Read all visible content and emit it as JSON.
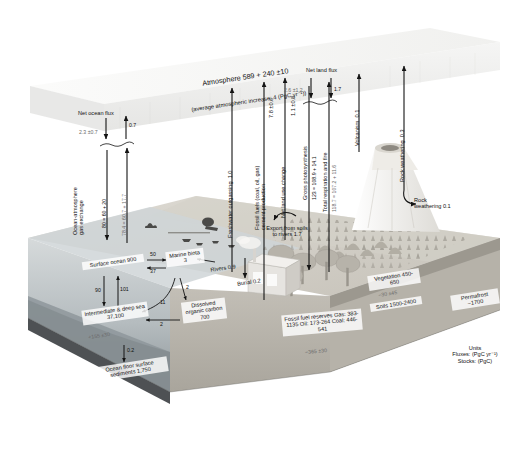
{
  "figure": {
    "units_box": {
      "heading": "Units",
      "fluxes": "Fluxes: (PgC yr⁻¹)",
      "stocks": "Stocks: (PgC)"
    }
  },
  "atmosphere": {
    "line1": "Atmosphere 589 + 240 ±10",
    "line2": "(average atmospheric increase: 4 (PgC yr⁻¹))"
  },
  "ocean": {
    "net_ocean_flux_label": "Net ocean flux",
    "net_ocean_flux_down": "2.3 ±0.7",
    "net_ocean_flux_up": "0.7",
    "gas_exchange_label": "Ocean-atmosphere\ngas exchange",
    "gas_exchange_down": "80 = 60 + 20",
    "gas_exchange_up": "78.4 = 60.7 + 17.7",
    "surface_ocean": "Surface ocean\n900",
    "down_flux": "90",
    "up_flux": "101",
    "intermediate_deep": "Intermediate\n& deep sea\n37,100",
    "intermediate_change": "+155 ±30",
    "to_sediments": "0.2",
    "sediments": "Ocean floor\nsurface sediments\n1,750",
    "marine_biota": "Marine\nbiota\n3",
    "biota_in": "50",
    "biota_out": "37",
    "biota_to_doc": "2",
    "doc": "Dissolved\norganic\ncarbon\n700",
    "doc_to_deep": "2",
    "biota_to_deep": "11",
    "rivers": "Rivers\n0.9",
    "burial": "Burial\n0.2",
    "freshwater_outgassing": "Freshwater outgassing  1.0"
  },
  "land": {
    "fossil_fuels": "Fossil fuels (coal, oil, gas)\ncement production",
    "fossil_fuels_value": "7.8 ±0.6",
    "net_land_use_change": "Net land use change",
    "net_land_use_change_value": "1.1 ±0.8",
    "net_land_flux_label": "Net land flux",
    "net_land_flux_down": "2.6 ±1.2",
    "net_land_flux_up": "1.7",
    "gross_photosynthesis": "Gross photosynthesis",
    "gross_photosynthesis_value": "123 = 108.9 + 14.1",
    "total_respiration": "Total respiration and fire",
    "total_respiration_value": "118.7 = 107.2 + 11.6",
    "export_soils_rivers": "Export from\nsoils to rivers\n1.7",
    "volcanism": "Volcanism  0.1",
    "rock_weathering_top": "Rock weathering  0.3",
    "rock_weathering_land": "Rock\nweathering\n0.1",
    "vegetation": "Vegetation\n450-650",
    "vegetation_soils_change": "−30 ±45",
    "soils": "Soils\n1500-2400",
    "permafrost": "Permafrost\n~1700",
    "fossil_fuel_reserves": "Fossil fuel reserves\nGas: 383-1135\nOil: 173-264\nCoal: 446-541",
    "fossil_fuel_reserves_change": "−365 ±30"
  },
  "colors": {
    "background": "#ffffff",
    "atmosphere_slab": "#ededec",
    "ocean_block": "#cfd4d6",
    "ocean_deep": "#9aa2a6",
    "land_block": "#c9c6c0",
    "land_surface": "#d7d4cd",
    "arrow": "#141414",
    "text": "#111111",
    "text_grey": "#6b6b6b",
    "box_fill": "#f7f7f5",
    "volcano": "#f2f1ee",
    "vegetation": "#a9a59c"
  }
}
